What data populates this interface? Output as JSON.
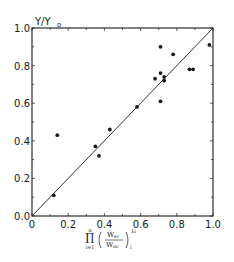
{
  "chart_data": {
    "type": "scatter",
    "title": "",
    "xlabel": "∏(i=1..n) (W_ei / W_oc)_i^λi",
    "xlabel_parts": {
      "prod": "∏",
      "upper": "n",
      "lower": "i=1",
      "num": "W",
      "num_sub": "ei",
      "den": "W",
      "den_sub": "oc",
      "sup": "λi",
      "sub": "i"
    },
    "ylabel": "Y/Y",
    "ylabel_sub": "o",
    "xlim": [
      0.0,
      1.0
    ],
    "ylim": [
      0.0,
      1.0
    ],
    "x_ticks": [
      "0",
      "0.2",
      "0.4",
      "0.6",
      "0.8",
      "1.0"
    ],
    "y_ticks": [
      "0.0",
      "0.2",
      "0.4",
      "0.6",
      "0.8",
      "1.0"
    ],
    "grid": false,
    "reference_line": {
      "type": "y=x",
      "from": [
        0,
        0
      ],
      "to": [
        1,
        1
      ]
    },
    "points": [
      {
        "x": 0.12,
        "y": 0.11
      },
      {
        "x": 0.14,
        "y": 0.43
      },
      {
        "x": 0.35,
        "y": 0.37
      },
      {
        "x": 0.37,
        "y": 0.32
      },
      {
        "x": 0.43,
        "y": 0.46
      },
      {
        "x": 0.58,
        "y": 0.58
      },
      {
        "x": 0.68,
        "y": 0.73
      },
      {
        "x": 0.71,
        "y": 0.9
      },
      {
        "x": 0.71,
        "y": 0.76
      },
      {
        "x": 0.71,
        "y": 0.61
      },
      {
        "x": 0.73,
        "y": 0.74
      },
      {
        "x": 0.73,
        "y": 0.72
      },
      {
        "x": 0.78,
        "y": 0.86
      },
      {
        "x": 0.87,
        "y": 0.78
      },
      {
        "x": 0.89,
        "y": 0.78
      },
      {
        "x": 0.98,
        "y": 0.91
      }
    ]
  },
  "colors": {
    "ink": "#1a1a1a",
    "background": "#ffffff"
  }
}
